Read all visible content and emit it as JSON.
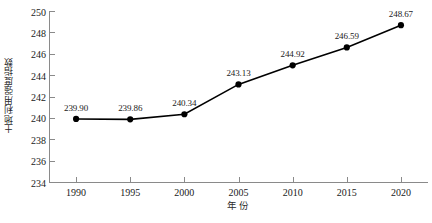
{
  "chart_data": {
    "type": "line",
    "title": "",
    "xlabel": "年份",
    "ylabel": "土地利用强度指数",
    "categories": [
      "1990",
      "1995",
      "2000",
      "2005",
      "2010",
      "2015",
      "2020"
    ],
    "x": [
      1990,
      1995,
      2000,
      2005,
      2010,
      2015,
      2020
    ],
    "values": [
      239.9,
      239.86,
      240.34,
      243.13,
      244.92,
      246.59,
      248.67
    ],
    "point_labels": [
      "239.90",
      "239.86",
      "240.34",
      "243.13",
      "244.92",
      "246.59",
      "248.67"
    ],
    "ylim": [
      234,
      250
    ],
    "ytick_labels": [
      "234",
      "236",
      "238",
      "240",
      "242",
      "244",
      "246",
      "248",
      "250"
    ],
    "yticks": [
      234,
      236,
      238,
      240,
      242,
      244,
      246,
      248,
      250
    ],
    "xlim": [
      1987.5,
      2022.5
    ],
    "grid": false,
    "legend": false,
    "legend_position": "none",
    "series": [
      {
        "name": "土地利用强度指数",
        "values": [
          239.9,
          239.86,
          240.34,
          243.13,
          244.92,
          246.59,
          248.67
        ],
        "line_color": "#000000",
        "marker_color": "#000000",
        "marker": "circle"
      }
    ],
    "colors": {
      "line": "#000000",
      "marker": "#000000",
      "axis": "#8a8a8a",
      "text": "#1a1a1a",
      "background": "#ffffff"
    }
  }
}
